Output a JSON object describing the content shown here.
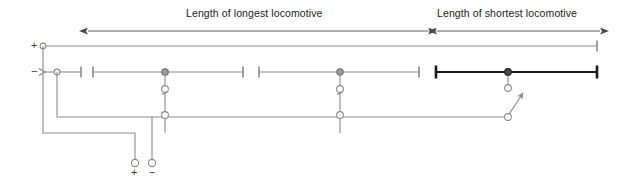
{
  "diagram": {
    "dimensions": [
      {
        "id": "longest",
        "label": "Length of longest locomotive",
        "x1": 88,
        "x2": 428,
        "y": 31,
        "arrows": "both"
      },
      {
        "id": "shortest",
        "label": "Length of shortest locomotive",
        "x1": 437,
        "x2": 600,
        "y": 31,
        "arrows": "both"
      }
    ],
    "terminals": {
      "top_positive": "+",
      "top_negative": "−",
      "bottom_positive": "+",
      "bottom_negative": "−"
    },
    "rails": {
      "positive_rail": {
        "y": 46,
        "x1": 43,
        "x2": 597,
        "color": "#8a8a8a"
      },
      "negative_segments": [
        {
          "x1": 57,
          "x2": 81,
          "y": 72,
          "color": "#8a8a8a",
          "bold": false
        },
        {
          "x1": 93,
          "x2": 243,
          "y": 72,
          "color": "#8a8a8a",
          "bold": false
        },
        {
          "x1": 259,
          "x2": 419,
          "y": 72,
          "color": "#8a8a8a",
          "bold": false
        },
        {
          "x1": 436,
          "x2": 597,
          "y": 72,
          "color": "#1a1a1a",
          "bold": true
        }
      ]
    },
    "switch_clusters": [
      {
        "id": "switch-1",
        "x": 165,
        "node_y": 72,
        "upper_y": 89,
        "lower_y": 115,
        "closed": true,
        "bus_y": 133
      },
      {
        "id": "switch-2",
        "x": 340,
        "node_y": 72,
        "upper_y": 89,
        "lower_y": 115,
        "closed": true,
        "bus_y": 133
      },
      {
        "id": "switch-3",
        "x": 508,
        "node_y": 72,
        "upper_y": 88,
        "lower_y": 117,
        "closed": false,
        "bus_y": 117
      }
    ],
    "buses": {
      "common_negative_y": 117,
      "positive_return_y": 133
    },
    "colors": {
      "wire_gray": "#8a8a8a",
      "wire_dark": "#1a1a1a",
      "node_fill": "#ffffff",
      "text": "#1a1a1a"
    }
  }
}
